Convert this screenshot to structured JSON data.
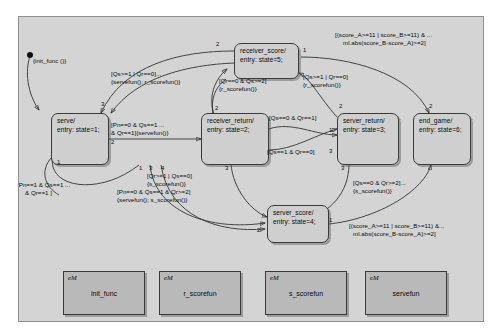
{
  "diagram": {
    "type": "stateflow-chart",
    "background_color": "#d4d4d4",
    "state_fill": "#cfcfcf",
    "function_fill": "#b9b9b9",
    "border_color": "#3a3a3a"
  },
  "default_transition": {
    "label": "{init_func ()}"
  },
  "states": [
    {
      "id": "serve",
      "name": "serve/",
      "entry": "entry: state=1;"
    },
    {
      "id": "receiver_return",
      "name": "receiver_return/",
      "entry": "entry: state=2;"
    },
    {
      "id": "receiver_score",
      "name": "receiver_score/",
      "entry": "entry: state=5;"
    },
    {
      "id": "server_return",
      "name": "server_return/",
      "entry": "entry: state=3;"
    },
    {
      "id": "end_game",
      "name": "end_game/",
      "entry": "entry: state=6;"
    },
    {
      "id": "server_score",
      "name": "server_score/",
      "entry": "entry: state=4;"
    }
  ],
  "transition_labels": [
    {
      "id": "t-serve-to-recret",
      "line1": "[Pn==0 & Qs==1 ...",
      "line2": "& Qr==1]{servefun()}"
    },
    {
      "id": "t-qs1-qr0",
      "line1": "[Qs>=1 | Qr==0]...",
      "line2": "{servefun(); r_scorefun()}"
    },
    {
      "id": "t-qr0-qs2",
      "line1": "[Qr==0 & Qs>=2]",
      "line2": "{r_scorefun()}"
    },
    {
      "id": "t-score-end-top",
      "line1": "[(score_A>=11 | score_B>=11) & ...",
      "line2": "ml.abs(score_B-score_A)>=2]"
    },
    {
      "id": "t-qs1-qr0-rscore",
      "line1": "[Qs>=1 | Qr==0]",
      "line2": "{r_scorefun()}"
    },
    {
      "id": "t-qs0-qr1",
      "line1": "[Qs==0 & Qr==1]",
      "line2": ""
    },
    {
      "id": "t-qs1-qr0b",
      "line1": "[Qs==1 & Qr==0]",
      "line2": ""
    },
    {
      "id": "t-qr1-qs0",
      "line1": "[Qr>=1 | Qs==0]",
      "line2": "{s_scorefun()}"
    },
    {
      "id": "t-qs0-qr2",
      "line1": "[Qs==0 & Qr>=2]...",
      "line2": "{s_scorefun()}"
    },
    {
      "id": "t-pn0-qs1-qr2",
      "line1": "[Pn==0 & Qs==1 & Qr>=2]",
      "line2": "{servefun(); s_scorefun()}"
    },
    {
      "id": "t-pn1-qs1-qr1",
      "line1": "[Pn==1 & Qs==1 ...",
      "line2": "& Qr==1 ]"
    },
    {
      "id": "t-score-end-bottom",
      "line1": "[(score_A>=11 | score_B>=11) &...",
      "line2": "ml.abs(score_B-score_A)>=2]"
    }
  ],
  "transition_orders": [
    "1",
    "2",
    "3",
    "4",
    "1",
    "2",
    "3",
    "1",
    "2",
    "2",
    "1",
    "2",
    "4",
    "1",
    "2",
    "2"
  ],
  "functions": [
    {
      "id": "init_func",
      "tag": "eM",
      "name": "init_func"
    },
    {
      "id": "r_scorefun",
      "tag": "eM",
      "name": "r_scorefun"
    },
    {
      "id": "s_scorefun",
      "tag": "eM",
      "name": "s_scorefun"
    },
    {
      "id": "servefun",
      "tag": "eM",
      "name": "servefun"
    }
  ]
}
